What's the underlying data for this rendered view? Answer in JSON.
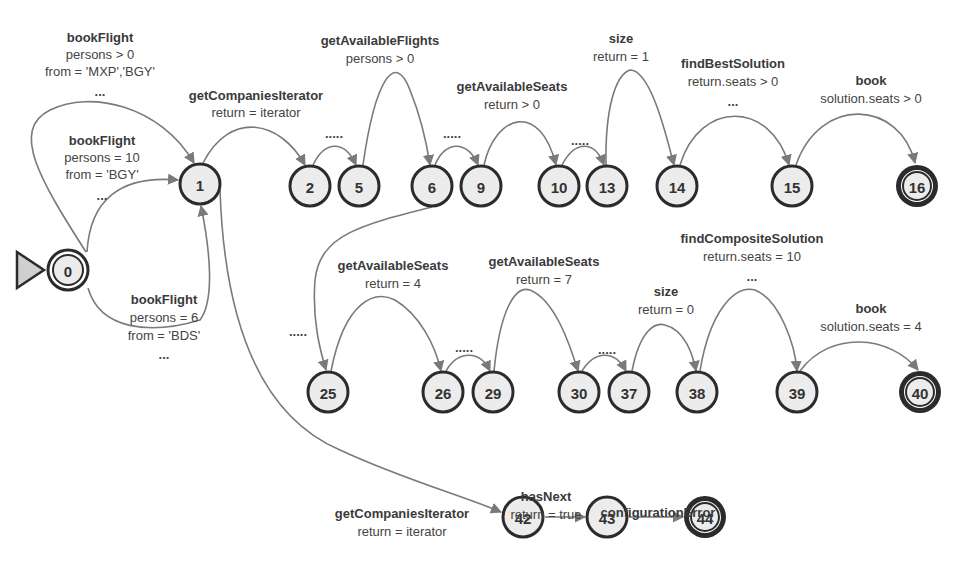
{
  "diagram": {
    "type": "state-machine",
    "nodes": [
      {
        "id": "0",
        "label": "0",
        "x": 68,
        "y": 270,
        "kind": "initial"
      },
      {
        "id": "1",
        "label": "1",
        "x": 200,
        "y": 184,
        "kind": "normal"
      },
      {
        "id": "2",
        "label": "2",
        "x": 310,
        "y": 186,
        "kind": "normal"
      },
      {
        "id": "5",
        "label": "5",
        "x": 359,
        "y": 186,
        "kind": "normal"
      },
      {
        "id": "6",
        "label": "6",
        "x": 432,
        "y": 186,
        "kind": "normal"
      },
      {
        "id": "9",
        "label": "9",
        "x": 481,
        "y": 186,
        "kind": "normal"
      },
      {
        "id": "10",
        "label": "10",
        "x": 559,
        "y": 186,
        "kind": "normal"
      },
      {
        "id": "13",
        "label": "13",
        "x": 607,
        "y": 186,
        "kind": "normal"
      },
      {
        "id": "14",
        "label": "14",
        "x": 677,
        "y": 186,
        "kind": "normal"
      },
      {
        "id": "15",
        "label": "15",
        "x": 792,
        "y": 186,
        "kind": "normal"
      },
      {
        "id": "16",
        "label": "16",
        "x": 917,
        "y": 186,
        "kind": "final"
      },
      {
        "id": "25",
        "label": "25",
        "x": 328,
        "y": 392,
        "kind": "normal"
      },
      {
        "id": "26",
        "label": "26",
        "x": 443,
        "y": 392,
        "kind": "normal"
      },
      {
        "id": "29",
        "label": "29",
        "x": 493,
        "y": 392,
        "kind": "normal"
      },
      {
        "id": "30",
        "label": "30",
        "x": 579,
        "y": 392,
        "kind": "normal"
      },
      {
        "id": "37",
        "label": "37",
        "x": 629,
        "y": 392,
        "kind": "normal"
      },
      {
        "id": "38",
        "label": "38",
        "x": 697,
        "y": 392,
        "kind": "normal"
      },
      {
        "id": "39",
        "label": "39",
        "x": 797,
        "y": 392,
        "kind": "normal"
      },
      {
        "id": "40",
        "label": "40",
        "x": 920,
        "y": 392,
        "kind": "final"
      },
      {
        "id": "42",
        "label": "42",
        "x": 523,
        "y": 517,
        "kind": "normal"
      },
      {
        "id": "43",
        "label": "43",
        "x": 607,
        "y": 517,
        "kind": "normal"
      },
      {
        "id": "44",
        "label": "44",
        "x": 705,
        "y": 517,
        "kind": "final"
      }
    ],
    "labels": {
      "e0_1a": {
        "name": "bookFlight",
        "lines": [
          "persons > 0",
          "from = 'MXP','BGY'",
          "..."
        ]
      },
      "e0_1b": {
        "name": "bookFlight",
        "lines": [
          "persons = 10",
          "from = 'BGY'",
          "..."
        ]
      },
      "e0_1c": {
        "name": "bookFlight",
        "lines": [
          "persons = 6",
          "from = 'BDS'",
          "..."
        ]
      },
      "e1_2": {
        "name": "getCompaniesIterator",
        "lines": [
          "return = iterator"
        ]
      },
      "e5_6": {
        "name": "getAvailableFlights",
        "lines": [
          "persons > 0"
        ]
      },
      "e9_10": {
        "name": "getAvailableSeats",
        "lines": [
          "return > 0"
        ]
      },
      "e13_14": {
        "name": "size",
        "lines": [
          "return = 1"
        ]
      },
      "e14_15": {
        "name": "findBestSolution",
        "lines": [
          "return.seats > 0",
          "..."
        ]
      },
      "e15_16": {
        "name": "book",
        "lines": [
          "solution.seats > 0"
        ]
      },
      "e25_26": {
        "name": "getAvailableSeats",
        "lines": [
          "return = 4"
        ]
      },
      "e29_30": {
        "name": "getAvailableSeats",
        "lines": [
          "return = 7"
        ]
      },
      "e37_38": {
        "name": "size",
        "lines": [
          "return = 0"
        ]
      },
      "e38_39": {
        "name": "findCompositeSolution",
        "lines": [
          "return.seats = 10",
          "..."
        ]
      },
      "e39_40": {
        "name": "book",
        "lines": [
          "solution.seats = 4"
        ]
      },
      "e1_42": {
        "name": "getCompaniesIterator",
        "lines": [
          "return = iterator"
        ]
      },
      "e42_43": {
        "name": "hasNext",
        "lines": [
          "return = true"
        ]
      },
      "e43_44": {
        "name": "configurationError",
        "lines": []
      }
    },
    "ellipsis": ".....",
    "colors": {
      "node_fill": "#ececec",
      "node_stroke": "#2b2b2b",
      "edge": "#7a7a7a",
      "text": "#333333"
    }
  }
}
